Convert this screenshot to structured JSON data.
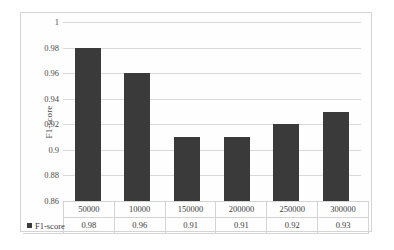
{
  "chart_data": {
    "type": "bar",
    "title": "",
    "xlabel": "",
    "ylabel": "F1-score",
    "ylim": [
      0.86,
      1
    ],
    "ytick_labels": [
      "1",
      "0.98",
      "0.96",
      "0.94",
      "0.92",
      "0.9",
      "0.88",
      "0.86"
    ],
    "ytick_values": [
      1,
      0.98,
      0.96,
      0.94,
      0.92,
      0.9,
      0.88,
      0.86
    ],
    "grid": true,
    "legend_position": "table-left",
    "categories": [
      "50000",
      "10000",
      "150000",
      "200000",
      "250000",
      "300000"
    ],
    "series": [
      {
        "name": "F1-score",
        "color": "#3a3a3a",
        "values": [
          0.98,
          0.96,
          0.91,
          0.91,
          0.92,
          0.93
        ],
        "value_labels": [
          "0.98",
          "0.96",
          "0.91",
          "0.91",
          "0.92",
          "0.93"
        ]
      }
    ]
  },
  "data_table": {
    "legend_label": "F1-score",
    "header_row": [
      "50000",
      "10000",
      "150000",
      "200000",
      "250000",
      "300000"
    ],
    "value_row": [
      "0.98",
      "0.96",
      "0.91",
      "0.91",
      "0.92",
      "0.93"
    ]
  }
}
